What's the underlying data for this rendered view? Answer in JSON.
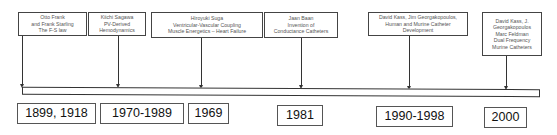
{
  "timeline": {
    "events": [
      {
        "lines": [
          "Otto Frank",
          "and Frank Starling",
          "The F-S law"
        ],
        "year": "1899, 1918"
      },
      {
        "lines": [
          "Kiichi Sagawa",
          "PV-Derived",
          "Hemodynamics"
        ],
        "year": "1970-1989"
      },
      {
        "lines": [
          "Hiroyuki Suga",
          "Ventricular-Vascular Coupling",
          "Muscle Energetics – Heart Failure"
        ],
        "year": "1969"
      },
      {
        "lines": [
          "Jaan Baan",
          "Invention of",
          "Conductance Catheters"
        ],
        "year": "1981"
      },
      {
        "lines": [
          "David Kass, Jim Georgakopoulos,",
          "Human and Murine Catheter Development"
        ],
        "year": "1990-1998"
      },
      {
        "lines": [
          "David Kass, J.",
          "Georgakopoulos",
          "Marc Feldman",
          "Dual Frequency",
          "Murine Catheters"
        ],
        "year": "2000"
      }
    ]
  }
}
